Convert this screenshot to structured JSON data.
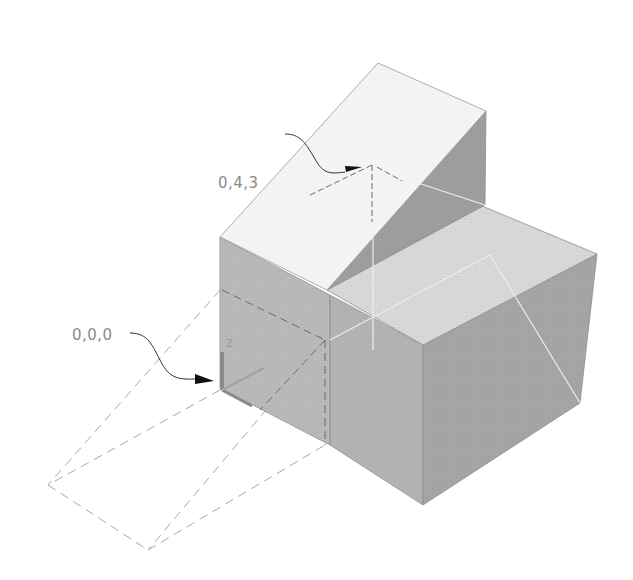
{
  "diagram": {
    "type": "isometric-3d-solid",
    "colors": {
      "background": "#ffffff",
      "ramp_top": "#f3f3f3",
      "ramp_side": "#9c9c9c",
      "front_left_face": "#b5b5b5",
      "front_right_face": "#ababab",
      "top_block_face": "#d6d6d6",
      "right_face": "#a3a3a3",
      "edge": "#8f8f8f",
      "dashed": "#9a9a9a",
      "dashed_dark": "#666666",
      "arrow": "#111111"
    },
    "callouts": [
      {
        "id": "point-043",
        "label": "0,4,3",
        "x": 218,
        "y": 183
      },
      {
        "id": "point-000",
        "label": "0,0,0",
        "x": 72,
        "y": 337
      }
    ],
    "ucs_icon": {
      "axis_label": "Z"
    }
  }
}
